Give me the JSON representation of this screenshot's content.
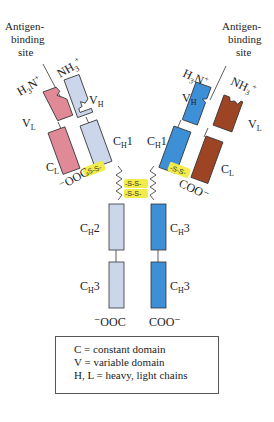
{
  "diagram": {
    "labels": {
      "antigen_site_left": [
        "Antigen-",
        "binding",
        "site"
      ],
      "antigen_site_right": [
        "Antigen-",
        "binding",
        "site"
      ],
      "left_light_N": "H3N+",
      "left_heavy_N": "NH3+",
      "right_heavy_N": "H3N+",
      "right_light_N": "NH3+",
      "VL": "V",
      "VL_sub": "L",
      "VH": "V",
      "VH_sub": "H",
      "CH1": "C",
      "CH1_sub": "H",
      "CH1_num": "1",
      "CL": "C",
      "CL_sub": "L",
      "CH2": "C",
      "CH2_sub": "H",
      "CH2_num": "2",
      "CH3": "C",
      "CH3_sub": "H",
      "CH3_num": "3",
      "left_light_C": "−OOC",
      "right_light_C": "COO−",
      "left_heavy_C": "−OOC",
      "right_heavy_C": "COO−",
      "disulfide": "S–S"
    },
    "colors": {
      "left_light": "#e08a97",
      "left_heavy": "#ccd6ea",
      "right_heavy": "#3d8fd6",
      "right_light": "#9c4423",
      "disulfide_bg": "#f2ec4a"
    }
  },
  "legend": {
    "lines": [
      "C = constant domain",
      "V = variable domain",
      "H, L = heavy, light chains"
    ]
  }
}
